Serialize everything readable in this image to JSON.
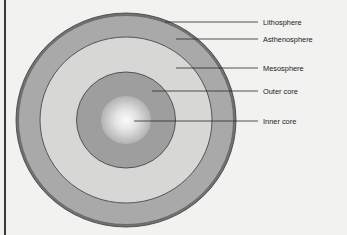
{
  "diagram": {
    "type": "earth-layers-cross-section",
    "colors": {
      "background": "#f2f2f0",
      "lithosphere": "#6e6e6e",
      "asthenosphere": "#a9a9a9",
      "mesosphere": "#d6d6d4",
      "outer_core": "#9c9c9c",
      "inner_core_center": "#fafafa",
      "inner_core_edge": "#b8b8b8",
      "outline": "#3a3a3a",
      "leader_line": "#2a2a2a"
    },
    "layers": [
      {
        "id": "lithosphere",
        "label": "Lithosphere"
      },
      {
        "id": "asthenosphere",
        "label": "Asthenosphere"
      },
      {
        "id": "mesosphere",
        "label": "Mesosphere"
      },
      {
        "id": "outer_core",
        "label": "Outer core"
      },
      {
        "id": "inner_core",
        "label": "Inner core"
      }
    ]
  }
}
